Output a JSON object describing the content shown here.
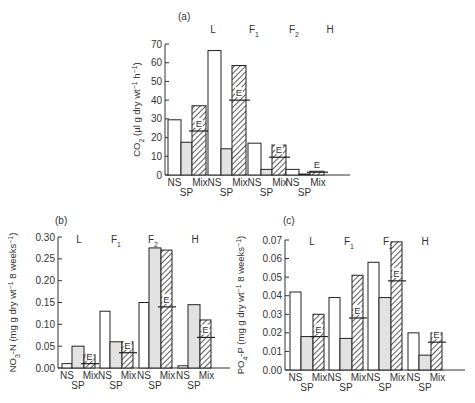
{
  "chart_data": [
    {
      "id": "a",
      "panel_label": "(a)",
      "type": "bar",
      "title": "",
      "ylabel": "CO2 (µl g dry wt⁻¹ h⁻¹)",
      "ylabel_parts": {
        "main": "CO",
        "sub": "2",
        "rest": " (µl g dry wt",
        "sup1": "−1",
        "mid": " h",
        "sup2": "−1",
        "end": ")"
      },
      "ylim": [
        0,
        70
      ],
      "yticks": [
        0,
        10,
        20,
        30,
        40,
        50,
        60,
        70
      ],
      "ytick_labels": [
        "0",
        "10",
        "20",
        "30",
        "40",
        "50",
        "60",
        "70"
      ],
      "groups": [
        "L",
        "F1",
        "F2",
        "H"
      ],
      "group_labels": [
        {
          "main": "L",
          "sub": ""
        },
        {
          "main": "F",
          "sub": "1"
        },
        {
          "main": "F",
          "sub": "2"
        },
        {
          "main": "H",
          "sub": ""
        }
      ],
      "categories": [
        "NS",
        "SP",
        "Mix"
      ],
      "x_tick_labels": {
        "upper": [
          "NS",
          "Mix"
        ],
        "lower": [
          "SP"
        ]
      },
      "series": [
        {
          "name": "NS",
          "style": "open",
          "values": [
            29.5,
            66.5,
            17,
            3
          ]
        },
        {
          "name": "SP",
          "style": "shaded",
          "values": [
            17.5,
            14,
            3,
            0.5
          ]
        },
        {
          "name": "Mix",
          "style": "hatched",
          "values": [
            37,
            58.5,
            16,
            2
          ]
        }
      ],
      "expected": {
        "label": "E",
        "values": [
          23.5,
          40,
          9.5,
          1.5
        ]
      }
    },
    {
      "id": "b",
      "panel_label": "(b)",
      "type": "bar",
      "title": "",
      "ylabel": "NO3-N (mg g dry wt⁻¹ 8 weeks⁻¹)",
      "ylabel_parts": {
        "main": "NO",
        "sub": "3",
        "rest": "-N (mg g dry wt",
        "sup1": "−1",
        "mid": " 8 weeks",
        "sup2": "−1",
        "end": ")"
      },
      "ylim": [
        0,
        0.3
      ],
      "yticks": [
        0,
        0.05,
        0.1,
        0.15,
        0.2,
        0.25,
        0.3
      ],
      "ytick_labels": [
        "0.00",
        "0.05",
        "0.10",
        "0.15",
        "0.20",
        "0.25",
        "0.30"
      ],
      "groups": [
        "L",
        "F1",
        "F2",
        "H"
      ],
      "group_labels": [
        {
          "main": "L",
          "sub": ""
        },
        {
          "main": "F",
          "sub": "1"
        },
        {
          "main": "F",
          "sub": "2"
        },
        {
          "main": "H",
          "sub": ""
        }
      ],
      "categories": [
        "NS",
        "SP",
        "Mix"
      ],
      "x_tick_labels": {
        "upper": [
          "NS",
          "Mix"
        ],
        "lower": [
          "SP"
        ]
      },
      "series": [
        {
          "name": "NS",
          "style": "open",
          "values": [
            0.01,
            0.13,
            0.15,
            0.005
          ]
        },
        {
          "name": "SP",
          "style": "shaded",
          "values": [
            0.05,
            0.06,
            0.275,
            0.145
          ]
        },
        {
          "name": "Mix",
          "style": "hatched",
          "values": [
            0.03,
            0.06,
            0.27,
            0.11
          ]
        }
      ],
      "expected": {
        "label": "E",
        "values": [
          0.01,
          0.035,
          0.14,
          0.07
        ]
      }
    },
    {
      "id": "c",
      "panel_label": "(c)",
      "type": "bar",
      "title": "",
      "ylabel": "PO4-P (mg g dry wt⁻¹ 8 weeks⁻¹)",
      "ylabel_parts": {
        "main": "PO",
        "sub": "4",
        "rest": "-P (mg g dry wt",
        "sup1": "−1",
        "mid": " 8 weeks",
        "sup2": "−1",
        "end": ")"
      },
      "ylim": [
        0,
        0.07
      ],
      "yticks": [
        0,
        0.01,
        0.02,
        0.03,
        0.04,
        0.05,
        0.06,
        0.07
      ],
      "ytick_labels": [
        "0.00",
        "0.01",
        "0.02",
        "0.03",
        "0.04",
        "0.05",
        "0.06",
        "0.07"
      ],
      "groups": [
        "L",
        "F1",
        "F2",
        "H"
      ],
      "group_labels": [
        {
          "main": "L",
          "sub": ""
        },
        {
          "main": "F",
          "sub": "1"
        },
        {
          "main": "F",
          "sub": "2"
        },
        {
          "main": "H",
          "sub": ""
        }
      ],
      "categories": [
        "NS",
        "SP",
        "Mix"
      ],
      "x_tick_labels": {
        "upper": [
          "NS",
          "Mix"
        ],
        "lower": [
          "SP"
        ]
      },
      "series": [
        {
          "name": "NS",
          "style": "open",
          "values": [
            0.042,
            0.039,
            0.058,
            0.02
          ]
        },
        {
          "name": "SP",
          "style": "shaded",
          "values": [
            0.018,
            0.017,
            0.039,
            0.008
          ]
        },
        {
          "name": "Mix",
          "style": "hatched",
          "values": [
            0.03,
            0.051,
            0.069,
            0.02
          ]
        }
      ],
      "expected": {
        "label": "E",
        "values": [
          0.018,
          0.028,
          0.048,
          0.015
        ]
      }
    }
  ],
  "colors": {
    "open": "#ffffff",
    "shaded": "#e2e2e2",
    "hatch": "#333333",
    "stroke": "#222222",
    "axis": "#333333"
  }
}
